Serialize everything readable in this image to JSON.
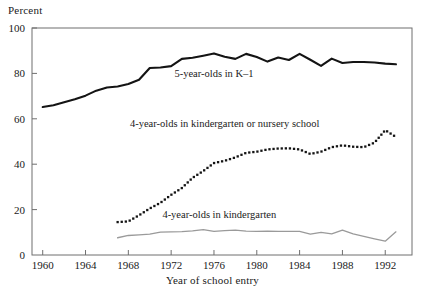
{
  "chart_data": {
    "type": "line",
    "title": "",
    "ylabel": "Percent",
    "xlabel": "Year of school entry",
    "ylim": [
      0,
      100
    ],
    "xlim": [
      1959,
      1994.5
    ],
    "yticks": [
      0,
      20,
      40,
      60,
      80,
      100
    ],
    "xticks": [
      1960,
      1964,
      1968,
      1972,
      1976,
      1980,
      1984,
      1988,
      1992
    ],
    "ytick_labels": [
      "0",
      "20",
      "40",
      "60",
      "80",
      "100"
    ],
    "xtick_labels": [
      "1960",
      "1964",
      "1968",
      "1972",
      "1976",
      "1980",
      "1984",
      "1988",
      "1992"
    ],
    "grid": false,
    "legend_position": "inline-annotations",
    "frame": "box",
    "series": [
      {
        "name": "5-year-olds in K–1",
        "style": "solid",
        "color": "#141414",
        "width": 2.1,
        "annotation": "5-year-olds in K–1",
        "annotation_x": 1976.0,
        "annotation_y": 78.5,
        "x": [
          1960,
          1961,
          1962,
          1963,
          1964,
          1965,
          1966,
          1967,
          1968,
          1969,
          1970,
          1971,
          1972,
          1973,
          1974,
          1975,
          1976,
          1977,
          1978,
          1979,
          1980,
          1981,
          1982,
          1983,
          1984,
          1985,
          1986,
          1987,
          1988,
          1989,
          1990,
          1991,
          1992,
          1993
        ],
        "values": [
          65.2,
          66.0,
          67.3,
          68.6,
          70.2,
          72.4,
          73.8,
          74.2,
          75.3,
          77.2,
          82.4,
          82.6,
          83.2,
          86.4,
          86.9,
          87.8,
          88.8,
          87.3,
          86.4,
          88.6,
          87.2,
          85.2,
          87.0,
          85.9,
          88.6,
          86.0,
          83.3,
          86.5,
          84.6,
          85.0,
          85.0,
          84.8,
          84.3,
          84.0
        ]
      },
      {
        "name": "4-year-olds in kindergarten or nursery school",
        "style": "dotted",
        "color": "#141414",
        "width": 2.3,
        "annotation": "4-year-olds in kindergarten or nursery school",
        "annotation_x": 1977.0,
        "annotation_y": 56.5,
        "x": [
          1967,
          1968,
          1969,
          1970,
          1971,
          1972,
          1973,
          1974,
          1975,
          1976,
          1977,
          1978,
          1979,
          1980,
          1981,
          1982,
          1983,
          1984,
          1985,
          1986,
          1987,
          1988,
          1989,
          1990,
          1991,
          1992,
          1993
        ],
        "values": [
          14.5,
          14.8,
          17.5,
          20.5,
          23.0,
          26.5,
          29.5,
          34.0,
          37.0,
          40.5,
          41.5,
          43.0,
          45.0,
          45.5,
          46.5,
          46.9,
          47.0,
          46.5,
          44.5,
          45.5,
          47.5,
          48.3,
          47.7,
          47.5,
          49.5,
          55.0,
          52.0
        ]
      },
      {
        "name": "4-year-olds in kindergarten",
        "style": "solid",
        "color": "#9a9a9a",
        "width": 1.3,
        "annotation": "4-year-olds in kindergarten",
        "annotation_x": 1976.5,
        "annotation_y": 16.5,
        "x": [
          1967,
          1968,
          1969,
          1970,
          1971,
          1972,
          1973,
          1974,
          1975,
          1976,
          1977,
          1978,
          1979,
          1980,
          1981,
          1982,
          1983,
          1984,
          1985,
          1986,
          1987,
          1988,
          1989,
          1990,
          1991,
          1992,
          1993
        ],
        "values": [
          7.6,
          8.6,
          8.9,
          9.2,
          10.1,
          10.2,
          10.3,
          10.6,
          11.2,
          10.4,
          10.7,
          11.0,
          10.5,
          10.4,
          10.5,
          10.4,
          10.4,
          10.4,
          9.2,
          10.0,
          9.3,
          11.0,
          9.3,
          8.2,
          7.1,
          6.1,
          10.2
        ]
      }
    ]
  }
}
